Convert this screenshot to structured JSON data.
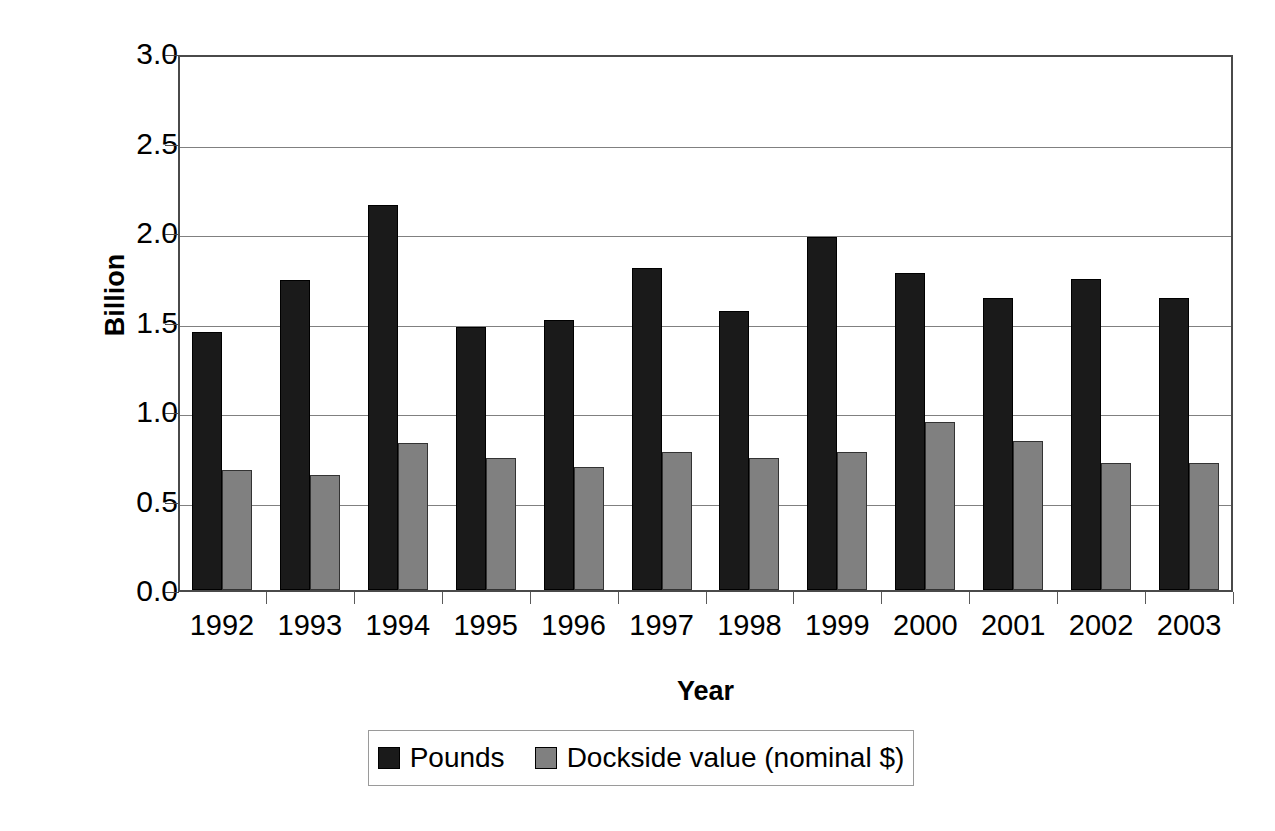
{
  "chart_data": {
    "type": "bar",
    "title": "",
    "xlabel": "Year",
    "ylabel": "Billion",
    "categories": [
      "1992",
      "1993",
      "1994",
      "1995",
      "1996",
      "1997",
      "1998",
      "1999",
      "2000",
      "2001",
      "2002",
      "2003"
    ],
    "series": [
      {
        "name": "Pounds",
        "color": "#1a1a1a",
        "values": [
          1.44,
          1.73,
          2.15,
          1.47,
          1.51,
          1.8,
          1.56,
          1.97,
          1.77,
          1.63,
          1.74,
          1.63
        ]
      },
      {
        "name": "Dockside value (nominal $)",
        "color": "#808080",
        "values": [
          0.67,
          0.64,
          0.82,
          0.74,
          0.69,
          0.77,
          0.74,
          0.77,
          0.94,
          0.83,
          0.71,
          0.71
        ]
      }
    ],
    "ylim": [
      0.0,
      3.0
    ],
    "ytick_labels": [
      "3.0",
      "2.5",
      "2.0",
      "1.5",
      "1.0",
      "0.5",
      "0.0"
    ],
    "ytick_values": [
      3.0,
      2.5,
      2.0,
      1.5,
      1.0,
      0.5,
      0.0
    ],
    "grid": "horizontal",
    "legend_position": "bottom"
  }
}
